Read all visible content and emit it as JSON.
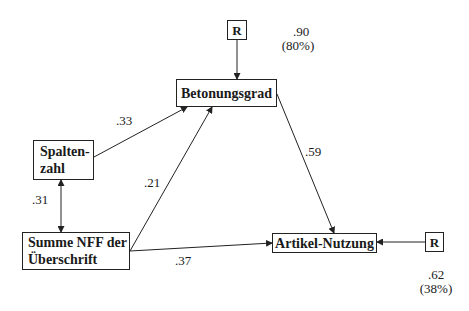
{
  "nodes": {
    "betonungsgrad": {
      "label": "Betonungsgrad"
    },
    "spaltenzahl": {
      "label": "Spalten-\nzahl"
    },
    "summe_nff": {
      "label": "Summe NFF der\nÜberschrift"
    },
    "artikel_nutzung": {
      "label": "Artikel-Nutzung"
    },
    "residual_top": {
      "label": "R"
    },
    "residual_right": {
      "label": "R"
    }
  },
  "paths": [
    {
      "from": "Spaltenzahl",
      "to": "Betonungsgrad",
      "coefficient": ".33"
    },
    {
      "from": "Summe NFF der Überschrift",
      "to": "Betonungsgrad",
      "coefficient": ".21"
    },
    {
      "from": "Summe NFF der Überschrift",
      "to": "Artikel-Nutzung",
      "coefficient": ".37"
    },
    {
      "from": "Betonungsgrad",
      "to": "Artikel-Nutzung",
      "coefficient": ".59"
    },
    {
      "from": "Spaltenzahl",
      "to": "Summe NFF der Überschrift",
      "coefficient": ".31",
      "type": "correlation"
    },
    {
      "from": "R",
      "to": "Betonungsgrad",
      "type": "residual"
    },
    {
      "from": "R",
      "to": "Artikel-Nutzung",
      "type": "residual"
    }
  ],
  "labels": {
    "c33": ".33",
    "c21": ".21",
    "c37": ".37",
    "c59": ".59",
    "c31": ".31",
    "res_top_value": ".90",
    "res_top_pct": "(80%)",
    "res_right_value": ".62",
    "res_right_pct": "(38%)"
  }
}
